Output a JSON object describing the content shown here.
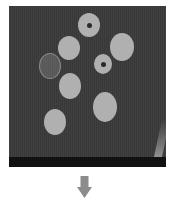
{
  "image": {
    "description": "Grayscale photo of eight round discs on a dark surface, followed by a downward arrow",
    "background_color": "#3a3a3a",
    "disc_color": "#b0b0b0",
    "arrow_color": "#8c8c8c"
  },
  "discs": [
    {
      "name": "top-disc-with-hole",
      "cx": 80,
      "cy": 19,
      "rx": 11,
      "ry": 12,
      "hole": true
    },
    {
      "name": "upper-left-disc",
      "cx": 60,
      "cy": 42,
      "rx": 11,
      "ry": 12,
      "hole": false
    },
    {
      "name": "right-large-disc",
      "cx": 113,
      "cy": 41,
      "rx": 12,
      "ry": 14,
      "hole": false
    },
    {
      "name": "middle-disc-with-hole",
      "cx": 94,
      "cy": 58,
      "rx": 9,
      "ry": 10,
      "hole": true
    },
    {
      "name": "faint-coin",
      "cx": 41,
      "cy": 60,
      "rx": 11,
      "ry": 13,
      "hole": false
    },
    {
      "name": "middle-left-disc",
      "cx": 61,
      "cy": 80,
      "rx": 11,
      "ry": 13,
      "hole": false
    },
    {
      "name": "lower-right-disc",
      "cx": 96,
      "cy": 101,
      "rx": 12,
      "ry": 15,
      "hole": false
    },
    {
      "name": "bottom-left-disc",
      "cx": 46,
      "cy": 116,
      "rx": 11,
      "ry": 13,
      "hole": false
    }
  ],
  "arrow": {
    "direction": "down",
    "icon": "arrow-down-icon"
  }
}
